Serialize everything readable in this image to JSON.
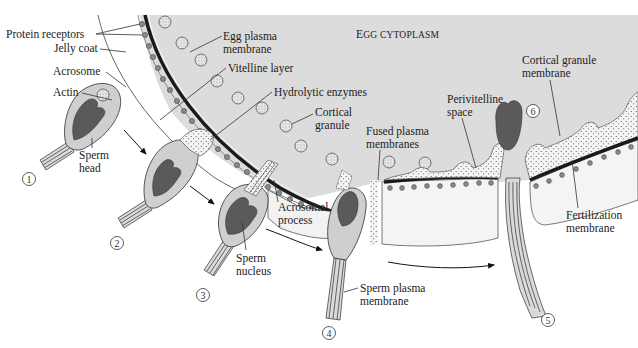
{
  "figure": {
    "region_label": {
      "first": "E",
      "rest": "GG CYTOPLASM"
    },
    "colors": {
      "cytoplasm": "#dcdcdc",
      "jelly": "#f0f0f0",
      "vitelline": "#ececec",
      "membrane": "#1a1a1a",
      "nucleus": "#5a5a5a",
      "sperm_body": "#cfcfcf",
      "granule": "#d8d8d8",
      "receptor": "#8a8a8a",
      "background": "#ffffff"
    }
  },
  "labels": {
    "protein_receptors": "Protein receptors",
    "jelly_coat": "Jelly coat",
    "acrosome": "Acrosome",
    "actin": "Actin",
    "sperm_head": [
      "Sperm",
      "head"
    ],
    "egg_plasma_membrane": [
      "Egg plasma",
      "membrane"
    ],
    "vitelline_layer": "Vitelline layer",
    "hydrolytic_enzymes": "Hydrolytic enzymes",
    "cortical_granule": [
      "Cortical",
      "granule"
    ],
    "fused_plasma_membranes": [
      "Fused plasma",
      "membranes"
    ],
    "perivitelline_space": [
      "Perivitelline",
      "space"
    ],
    "cortical_granule_membrane": [
      "Cortical granule",
      "membrane"
    ],
    "acrosomal_process": [
      "Acrosomal",
      "process"
    ],
    "sperm_nucleus": [
      "Sperm",
      "nucleus"
    ],
    "sperm_plasma_membrane": [
      "Sperm plasma",
      "membrane"
    ],
    "fertilization_membrane": [
      "Fertilization",
      "membrane"
    ]
  },
  "steps": [
    {
      "id": "1",
      "glyph": "1"
    },
    {
      "id": "2",
      "glyph": "2"
    },
    {
      "id": "3",
      "glyph": "3"
    },
    {
      "id": "4",
      "glyph": "4"
    },
    {
      "id": "5",
      "glyph": "5"
    },
    {
      "id": "6",
      "glyph": "6"
    }
  ]
}
